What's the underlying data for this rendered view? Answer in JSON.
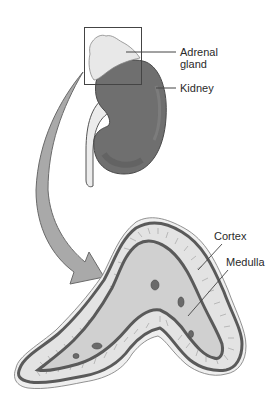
{
  "figure": {
    "labels": {
      "adrenal_line1": "Adrenal",
      "adrenal_line2": "gland",
      "kidney": "Kidney",
      "cortex": "Cortex",
      "medulla": "Medulla"
    },
    "colors": {
      "adrenal_gland": "#e6e6e6",
      "kidney": "#6e6e6e",
      "ureter": "#ececec",
      "arrow": "#a9a9a9",
      "cortex_band": "#e2e2e2",
      "medulla": "#cfcfcf",
      "outline": "#5a5a5a",
      "capsule": "#efefef"
    }
  }
}
